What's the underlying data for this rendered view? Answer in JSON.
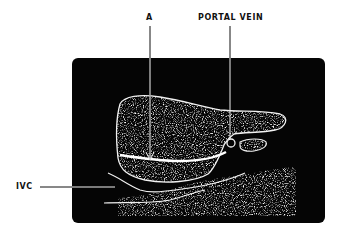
{
  "figure": {
    "type": "ultrasound-schematic",
    "labels": {
      "a": "A",
      "portal_vein": "PORTAL VEIN",
      "ivc": "IVC"
    },
    "colors": {
      "background": "#ffffff",
      "scan_field": "#050505",
      "tissue_outline": "#f2f2f2",
      "label_text": "#111111"
    }
  }
}
